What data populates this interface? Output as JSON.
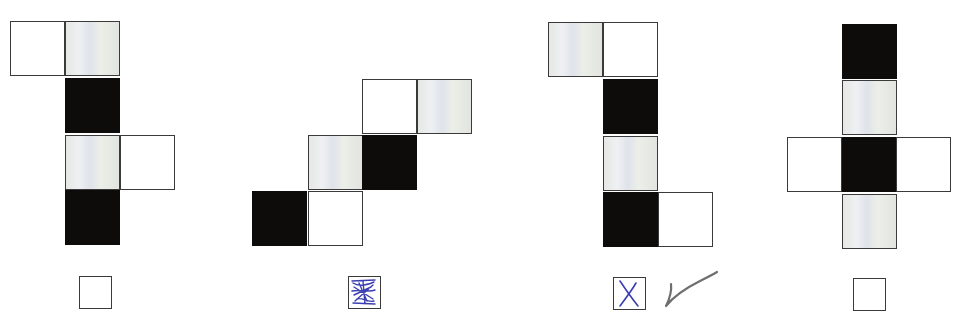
{
  "figures": [
    {
      "label": "option-1",
      "cells": [
        {
          "x": 10,
          "y": 21,
          "fill": "white"
        },
        {
          "x": 65,
          "y": 21,
          "fill": "gray"
        },
        {
          "x": 65,
          "y": 78,
          "fill": "black"
        },
        {
          "x": 65,
          "y": 135,
          "fill": "gray"
        },
        {
          "x": 120,
          "y": 135,
          "fill": "white"
        },
        {
          "x": 65,
          "y": 190,
          "fill": "black"
        }
      ],
      "answer_box": {
        "x": 79,
        "y": 276,
        "state": "empty"
      }
    },
    {
      "label": "option-2",
      "cells": [
        {
          "x": 362,
          "y": 79,
          "fill": "white"
        },
        {
          "x": 417,
          "y": 79,
          "fill": "gray"
        },
        {
          "x": 308,
          "y": 135,
          "fill": "gray"
        },
        {
          "x": 362,
          "y": 135,
          "fill": "black"
        },
        {
          "x": 252,
          "y": 191,
          "fill": "black"
        },
        {
          "x": 308,
          "y": 191,
          "fill": "white"
        }
      ],
      "answer_box": {
        "x": 348,
        "y": 276,
        "state": "scribbled-out"
      }
    },
    {
      "label": "option-3",
      "cells": [
        {
          "x": 548,
          "y": 22,
          "fill": "gray"
        },
        {
          "x": 603,
          "y": 22,
          "fill": "white"
        },
        {
          "x": 603,
          "y": 79,
          "fill": "black"
        },
        {
          "x": 603,
          "y": 136,
          "fill": "gray"
        },
        {
          "x": 603,
          "y": 192,
          "fill": "black"
        },
        {
          "x": 658,
          "y": 192,
          "fill": "white"
        }
      ],
      "answer_box": {
        "x": 613,
        "y": 277,
        "state": "crossed"
      },
      "check_mark": {
        "x": 662,
        "y": 266,
        "visible": true
      }
    },
    {
      "label": "option-4",
      "cells": [
        {
          "x": 842,
          "y": 24,
          "fill": "black"
        },
        {
          "x": 842,
          "y": 80,
          "fill": "gray"
        },
        {
          "x": 787,
          "y": 137,
          "fill": "white"
        },
        {
          "x": 842,
          "y": 137,
          "fill": "black"
        },
        {
          "x": 896,
          "y": 137,
          "fill": "white"
        },
        {
          "x": 842,
          "y": 194,
          "fill": "gray"
        }
      ],
      "answer_box": {
        "x": 853,
        "y": 278,
        "state": "empty"
      }
    }
  ],
  "cell_size": 55,
  "colors": {
    "black_cell": "#0e0b0b",
    "gray_cell": "#e4e6e4",
    "border": "#3a3a3a",
    "ink_blue": "#3b3fb0",
    "pencil_gray": "#555555"
  }
}
